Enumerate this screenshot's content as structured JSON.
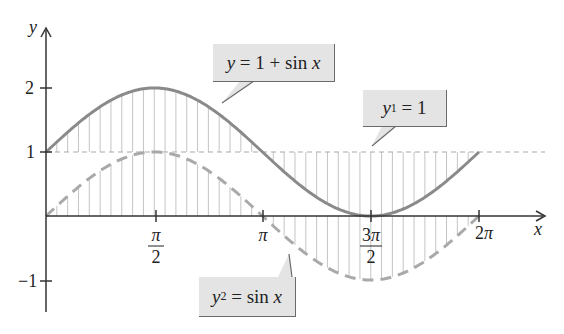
{
  "chart_data": {
    "type": "line",
    "title": "",
    "xlabel": "x",
    "ylabel": "y",
    "xlim": [
      0,
      7.0
    ],
    "ylim": [
      -1.3,
      2.9
    ],
    "x_ticks": [
      "π/2",
      "π",
      "3π/2",
      "2π"
    ],
    "x_tick_values": [
      1.5708,
      3.1416,
      4.7124,
      6.2832
    ],
    "y_ticks": [
      "-1",
      "1",
      "2"
    ],
    "y_tick_values": [
      -1,
      1,
      2
    ],
    "series": [
      {
        "name": "y = 1 + sin x",
        "style": "solid",
        "color": "#8a8a8a",
        "x": [
          0,
          0.7854,
          1.5708,
          2.3562,
          3.1416,
          3.927,
          4.7124,
          5.4978,
          6.2832
        ],
        "values": [
          1,
          1.707,
          2,
          1.707,
          1,
          0.293,
          0,
          0.293,
          1
        ]
      },
      {
        "name": "y2 = sin x",
        "style": "dashed",
        "color": "#a9a9a9",
        "x": [
          0,
          0.7854,
          1.5708,
          2.3562,
          3.1416,
          3.927,
          4.7124,
          5.4978,
          6.2832
        ],
        "values": [
          0,
          0.707,
          1,
          0.707,
          0,
          -0.707,
          -1,
          -0.707,
          0
        ]
      },
      {
        "name": "y1 = 1",
        "style": "dashed-thin",
        "color": "#a9a9a9",
        "x": [
          0,
          7.0
        ],
        "values": [
          1,
          1
        ]
      }
    ],
    "annotations": [
      "y = 1 + sin x",
      "y1 = 1",
      "y2 = sin x"
    ],
    "hatching": "vertical lines between y=1+sin x and y=1, and between y=sin x and y=0, over [0, 2π]",
    "grid": false,
    "legend": "none (callout labels)"
  },
  "labels": {
    "y_axis": "y",
    "x_axis": "x",
    "y_tick_2": "2",
    "y_tick_1": "1",
    "y_tick_neg1": "−1"
  },
  "callouts": {
    "sum": {
      "lhs": "y",
      "rhs_num": "1 + sin",
      "rhs_var": "x"
    },
    "y1": {
      "var": "y",
      "sub": "1",
      "rhs": "= 1"
    },
    "y2": {
      "var": "y",
      "sub": "2",
      "rhs": "= sin",
      "rhs_var": "x"
    }
  },
  "colors": {
    "curve_solid": "#8a8a8a",
    "curve_dashed": "#a9a9a9",
    "hatch": "#c4c4c4",
    "axis": "#333333",
    "callout_bg": "#e4e4e4"
  }
}
